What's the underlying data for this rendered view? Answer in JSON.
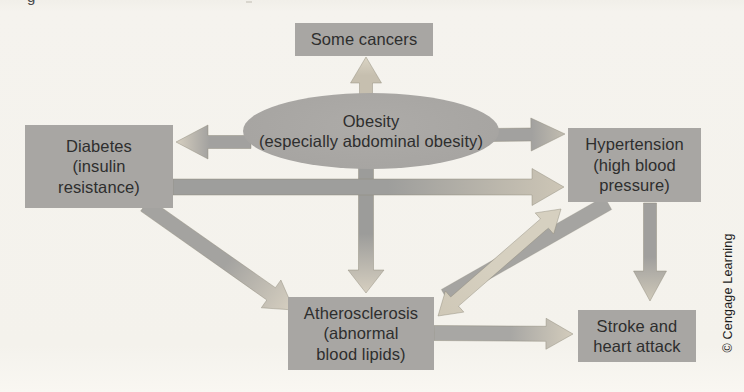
{
  "figure": {
    "caption_fragment": "g",
    "credit": "© Cengage Learning",
    "background": "#f5f3ee"
  },
  "colors": {
    "node_fill": "#a8a6a3",
    "node_text": "#2e2e2e",
    "arrow_dark": "#9f9e9c",
    "arrow_light": "#d7d1c1",
    "arrow_outline": "#8f8a7a"
  },
  "nodes": {
    "some_cancers": {
      "lines": [
        "Some cancers"
      ]
    },
    "obesity": {
      "lines": [
        "Obesity",
        "(especially abdominal obesity)"
      ]
    },
    "diabetes": {
      "lines": [
        "Diabetes",
        "(insulin",
        "resistance)"
      ]
    },
    "hypertension": {
      "lines": [
        "Hypertension",
        "(high blood",
        "pressure)"
      ]
    },
    "atherosclerosis": {
      "lines": [
        "Atherosclerosis",
        "(abnormal",
        "blood lipids)"
      ]
    },
    "stroke": {
      "lines": [
        "Stroke and",
        "heart attack"
      ]
    }
  },
  "edges": [
    {
      "name": "obesity-to-atherosclerosis",
      "type": "arrow",
      "from": [
        366,
        161
      ],
      "to": [
        366,
        293
      ],
      "shaft": 15,
      "head_w": 36,
      "head_len": 23,
      "c1": "#9c9c9a",
      "c2": "#d6cfc0"
    },
    {
      "name": "diabetes-to-hypertension",
      "type": "arrow",
      "from": [
        173,
        187
      ],
      "to": [
        564,
        187
      ],
      "shaft": 16,
      "head_w": 37,
      "head_len": 32,
      "c1": "#9e9e9c",
      "c2": "#cdc6b6"
    },
    {
      "name": "obesity-to-diabetes",
      "type": "arrow",
      "from": [
        251,
        142
      ],
      "to": [
        176,
        142
      ],
      "shaft": 13,
      "head_w": 34,
      "head_len": 32,
      "c1": "#a2a19f",
      "c2": "#d6cfc0"
    },
    {
      "name": "obesity-to-hypertension",
      "type": "arrow",
      "from": [
        491,
        135
      ],
      "to": [
        565,
        134
      ],
      "shaft": 13,
      "head_w": 33,
      "head_len": 34,
      "c1": "#a2a19f",
      "c2": "#c2bdb0"
    },
    {
      "name": "obesity-to-some-cancers",
      "type": "arrow",
      "from": [
        366,
        98
      ],
      "to": [
        366,
        57
      ],
      "shaft": 13,
      "head_w": 31,
      "head_len": 26,
      "c1": "#c6bfaf",
      "c2": "#dad4c4"
    },
    {
      "name": "diabetes-to-atherosclerosis",
      "type": "arrow",
      "from": [
        145,
        205
      ],
      "to": [
        294,
        310
      ],
      "shaft": 15,
      "head_w": 34,
      "head_len": 28,
      "c1": "#a4a3a0",
      "c2": "#d7d0c1"
    },
    {
      "name": "hypertension-to-stroke",
      "type": "arrow",
      "from": [
        650,
        203
      ],
      "to": [
        650,
        301
      ],
      "shaft": 13,
      "head_w": 33,
      "head_len": 30,
      "c1": "#a09f9d",
      "c2": "#cfc9b9"
    },
    {
      "name": "atherosclerosis-to-stroke",
      "type": "arrow",
      "from": [
        434,
        333
      ],
      "to": [
        573,
        334
      ],
      "shaft": 15,
      "head_w": 31,
      "head_len": 27,
      "c1": "#a8a7a4",
      "c2": "#d3ccbc"
    },
    {
      "name": "hypertension-to-atherosclerosis-band",
      "type": "band",
      "from": [
        608,
        203
      ],
      "to": [
        445,
        296
      ],
      "shaft": 15,
      "head_w": 0,
      "head_len": 0,
      "c1": "#a5a4a1",
      "c2": "#a5a4a1"
    },
    {
      "name": "atherosclerosis-hypertension-double-arrow",
      "type": "double",
      "from": [
        438,
        316
      ],
      "to": [
        561,
        209
      ],
      "shaft": 12,
      "head_w": 28,
      "head_len": 22,
      "c1": "#cfc8b7",
      "c2": "#d6d0c0"
    }
  ]
}
